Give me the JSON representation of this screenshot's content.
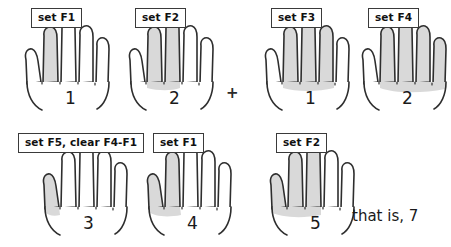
{
  "figure": {
    "title_text_visible": false,
    "outline_color": "#2e2e2e",
    "shade_color": "#d9d9d9",
    "background": "#ffffff"
  },
  "operator": {
    "plus_symbol": "+"
  },
  "caption": {
    "text": "that is, 7"
  },
  "hands": [
    {
      "id": "hand-1",
      "label": "set F1",
      "counter": "1",
      "shaded_digits": [
        "index"
      ],
      "row": 1
    },
    {
      "id": "hand-2",
      "label": "set F2",
      "counter": "2",
      "shaded_digits": [
        "index",
        "middle"
      ],
      "row": 1
    },
    {
      "id": "hand-3",
      "label": "set F3",
      "counter": "1",
      "shaded_digits": [
        "index",
        "middle",
        "ring"
      ],
      "row": 1
    },
    {
      "id": "hand-4",
      "label": "set F4",
      "counter": "2",
      "shaded_digits": [
        "index",
        "middle",
        "ring",
        "pinky"
      ],
      "row": 1
    },
    {
      "id": "hand-5",
      "label": "set F5, clear F4-F1",
      "counter": "3",
      "shaded_digits": [
        "thumb"
      ],
      "row": 2
    },
    {
      "id": "hand-6",
      "label": "set F1",
      "counter": "4",
      "shaded_digits": [
        "thumb",
        "index"
      ],
      "row": 2
    },
    {
      "id": "hand-7",
      "label": "set F2",
      "counter": "5",
      "shaded_digits": [
        "thumb",
        "index",
        "middle"
      ],
      "row": 2
    }
  ]
}
